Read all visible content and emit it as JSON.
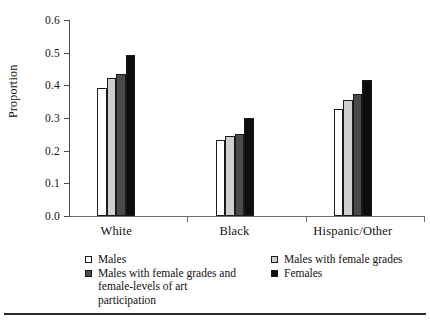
{
  "chart_data": {
    "type": "bar",
    "title": "",
    "subtitle": "",
    "xlabel": "",
    "ylabel": "Proportion",
    "categories": [
      "White",
      "Black",
      "Hispanic/Other"
    ],
    "series": [
      {
        "name": "Males",
        "color": "#ffffff",
        "values": [
          0.391,
          0.233,
          0.327
        ]
      },
      {
        "name": "Males with female grades",
        "color": "#cfcfcf",
        "values": [
          0.424,
          0.244,
          0.356
        ]
      },
      {
        "name": "Males with female grades and female-levels of art participation",
        "color": "#4a4a4a",
        "values": [
          0.436,
          0.252,
          0.372
        ]
      },
      {
        "name": "Females",
        "color": "#0d0d0d",
        "values": [
          0.492,
          0.3,
          0.416
        ]
      }
    ],
    "ylim": [
      0.0,
      0.6
    ],
    "ytick_labels": [
      "0.0",
      "0.1",
      "0.2",
      "0.3",
      "0.4",
      "0.5",
      "0.6"
    ],
    "ytick_values": [
      0.0,
      0.1,
      0.2,
      0.3,
      0.4,
      0.5,
      0.6
    ],
    "grid": false,
    "legend_position": "bottom",
    "legend_columns": 2,
    "legend_entries_left": [
      {
        "label": "Males",
        "swatch": "#ffffff"
      },
      {
        "label": "Males with female grades and female-levels of art participation",
        "swatch": "#4a4a4a"
      }
    ],
    "legend_entries_right": [
      {
        "label": "Males with female grades",
        "swatch": "#cfcfcf"
      },
      {
        "label": "Females",
        "swatch": "#0d0d0d"
      }
    ]
  },
  "colors": {
    "axis": "#4c4c4c",
    "baseline": "#6a6a6a",
    "bar_outline": "#1a1a1a",
    "text": "#111111",
    "rule": "#2b2b2b"
  }
}
